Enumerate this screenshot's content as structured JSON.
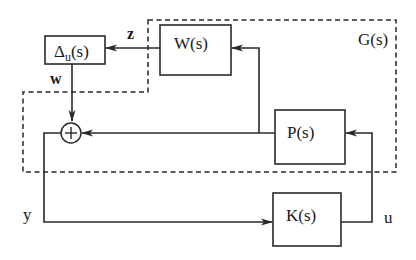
{
  "diagram": {
    "type": "block-diagram",
    "region": {
      "label": "G(s)",
      "style": "dashed"
    },
    "blocks": [
      {
        "id": "delta",
        "label_main": "Δ",
        "label_sub": "u",
        "label_tail": "(s)"
      },
      {
        "id": "W",
        "label": "W(s)"
      },
      {
        "id": "P",
        "label": "P(s)"
      },
      {
        "id": "K",
        "label": "K(s)"
      }
    ],
    "summing_junction": {
      "symbol": "+"
    },
    "signals": {
      "z": "z",
      "w": "w",
      "y": "y",
      "u": "u"
    },
    "edges": [
      {
        "from": "W",
        "to": "delta",
        "signal": "z"
      },
      {
        "from": "delta",
        "to": "sum",
        "signal": "w"
      },
      {
        "from": "P",
        "to": "sum"
      },
      {
        "from": "P",
        "to": "W"
      },
      {
        "from": "sum",
        "to": "K",
        "signal": "y"
      },
      {
        "from": "K",
        "to": "P",
        "signal": "u"
      }
    ]
  }
}
